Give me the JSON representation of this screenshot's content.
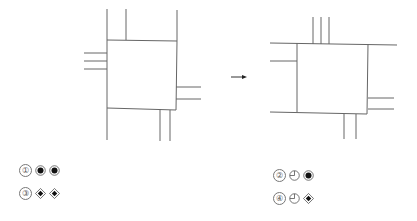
{
  "figures": {
    "left": {
      "label": "intersection-before"
    },
    "arrow": {
      "label": "transform-arrow"
    },
    "right": {
      "label": "intersection-after"
    }
  },
  "options": [
    {
      "number": "①",
      "symbols": [
        "circle-filled",
        "circle-filled"
      ]
    },
    {
      "number": "②",
      "symbols": [
        "circle-quarter",
        "circle-filled"
      ]
    },
    {
      "number": "③",
      "symbols": [
        "diamond-filled",
        "diamond-filled"
      ]
    },
    {
      "number": "④",
      "symbols": [
        "circle-quarter",
        "diamond-filled"
      ]
    }
  ],
  "colors": {
    "line": "#555555",
    "ink": "#111111"
  }
}
